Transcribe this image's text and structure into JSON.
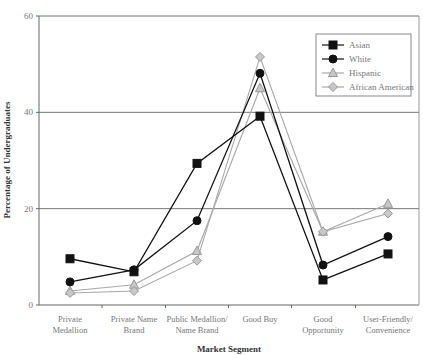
{
  "chart_data": {
    "type": "line",
    "title": "",
    "xlabel": "Market Segment",
    "ylabel": "Percentage of Undergraduates",
    "ylim": [
      0,
      60
    ],
    "yticks": [
      0,
      20,
      40,
      60
    ],
    "grid": true,
    "legend_position": "upper right (inside)",
    "categories": [
      [
        "Private",
        "Medallion"
      ],
      [
        "Private Name",
        "Brand"
      ],
      [
        "Public Medallion/",
        "Name Brand"
      ],
      [
        "Good Buy"
      ],
      [
        "Good",
        "Opportunity"
      ],
      [
        "User-Friendly/",
        "Convenience"
      ]
    ],
    "series": [
      {
        "name": "Asian",
        "marker": "square",
        "color": "#111111",
        "values": [
          9.6,
          6.9,
          29.4,
          39.2,
          5.2,
          10.6
        ]
      },
      {
        "name": "White",
        "marker": "circle",
        "color": "#111111",
        "values": [
          4.8,
          7.3,
          17.5,
          48.1,
          8.3,
          14.2
        ]
      },
      {
        "name": "Hispanic",
        "marker": "triangle",
        "color": "#a8a8a8",
        "values": [
          2.9,
          4.2,
          11.2,
          45.0,
          15.2,
          21.0
        ]
      },
      {
        "name": "African American",
        "marker": "diamond",
        "color": "#a8a8a8",
        "values": [
          2.5,
          2.9,
          9.2,
          51.5,
          15.2,
          19.0
        ]
      }
    ]
  }
}
